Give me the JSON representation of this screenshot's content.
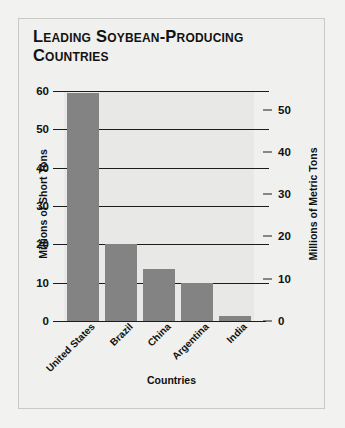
{
  "chart_data": {
    "type": "bar",
    "title": "Leading Soybean-Producing Countries",
    "categories": [
      "United States",
      "Brazil",
      "China",
      "Argentina",
      "India"
    ],
    "values": [
      59.5,
      20.0,
      13.5,
      9.8,
      1.3
    ],
    "xlabel": "Countries",
    "ylabel": "Millions of Short Tons",
    "ylabel_right": "Millions of Metric Tons",
    "ylim": [
      0,
      60
    ],
    "yticks": [
      0,
      10,
      20,
      30,
      40,
      50,
      60
    ],
    "ylim_right": [
      0,
      54.4
    ],
    "yticks_right": [
      0,
      10,
      20,
      30,
      40,
      50
    ],
    "grid": true,
    "legend": "none",
    "bar_color": "#838383",
    "plot_background": "#e8e8e6",
    "axis_color": "#1c1c1c"
  }
}
